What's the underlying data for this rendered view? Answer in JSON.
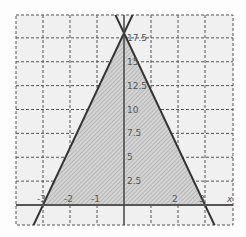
{
  "chart_data": {
    "type": "line",
    "title": "",
    "xlabel": "x",
    "ylabel": "y",
    "xlim": [
      -4,
      4
    ],
    "ylim": [
      -2,
      20
    ],
    "grid": true,
    "grid_style": "dashed",
    "x_ticks": [
      -3,
      -2,
      -1,
      2,
      3
    ],
    "x_tick_labels": [
      "-3",
      "-2",
      "-1",
      "2",
      "3"
    ],
    "y_ticks": [
      2.5,
      5,
      7.5,
      10,
      12.5,
      15,
      17.5
    ],
    "y_tick_labels": [
      "2.5",
      "5",
      "7.5",
      "10",
      "12.5",
      "15",
      "17.5"
    ],
    "series": [
      {
        "name": "line-left",
        "equation": "y = 6x + 18",
        "x": [
          -4,
          0.4
        ],
        "y": [
          -6,
          20.4
        ]
      },
      {
        "name": "line-right",
        "equation": "y = -6x + 18",
        "x": [
          -0.4,
          4
        ],
        "y": [
          20.4,
          -6
        ]
      }
    ],
    "shaded_region": {
      "description": "Triangle bounded by the two lines and the x-axis",
      "vertices": [
        [
          -3,
          0
        ],
        [
          0,
          18
        ],
        [
          3,
          0
        ]
      ]
    },
    "colors": {
      "line": "#333333",
      "grid": "#555555",
      "fill": "#c8c8c8",
      "axis": "#555555"
    }
  }
}
